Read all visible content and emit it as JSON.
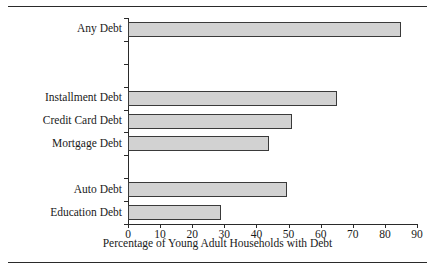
{
  "chart_data": {
    "type": "bar",
    "orientation": "horizontal",
    "title": "",
    "xlabel": "Percentage of Young Adult Households with Debt",
    "ylabel": "Types of Debt",
    "xlim": [
      0,
      90
    ],
    "xticks": [
      0,
      10,
      20,
      30,
      40,
      50,
      60,
      70,
      80,
      90
    ],
    "xtick_labels": [
      "0",
      "10",
      "20",
      "30",
      "40",
      "50",
      "60",
      "70",
      "80",
      "90"
    ],
    "grid": false,
    "legend": null,
    "bar_color": "#d2d2d2",
    "bar_edge_color": "#3a3a3a",
    "categories": [
      "Any Debt",
      "Installment Debt",
      "Credit Card Debt",
      "Mortgage Debt",
      "Auto Debt",
      "Education Debt"
    ],
    "values": [
      85,
      65,
      51,
      44,
      49.5,
      29
    ],
    "bars": [
      {
        "label": "Any Debt",
        "value": 85,
        "slot": 0
      },
      {
        "label": "Installment Debt",
        "value": 65,
        "slot": 3
      },
      {
        "label": "Credit Card Debt",
        "value": 51,
        "slot": 4
      },
      {
        "label": "Mortgage Debt",
        "value": 44,
        "slot": 5
      },
      {
        "label": "Auto Debt",
        "value": 49.5,
        "slot": 7
      },
      {
        "label": "Education Debt",
        "value": 29,
        "slot": 8
      }
    ],
    "slot_count": 9
  }
}
